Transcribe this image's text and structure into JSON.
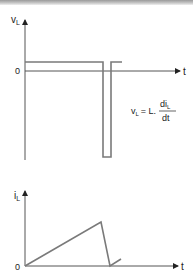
{
  "colors": {
    "axis": "#555555",
    "trace": "#7a7a7a",
    "text": "#222222",
    "top_bar": "#a8a8a8"
  },
  "graph_voltage": {
    "y_label_main": "v",
    "y_label_sub": "L",
    "x_label": "t",
    "origin_label": "0",
    "equation": {
      "lhs_main": "v",
      "lhs_sub": "L",
      "equals": "= L.",
      "numerator_main": "di",
      "numerator_sub": "L",
      "denominator": "dt"
    }
  },
  "graph_current": {
    "y_label_main": "i",
    "y_label_sub": "L",
    "x_label": "t",
    "origin_label": "0"
  }
}
